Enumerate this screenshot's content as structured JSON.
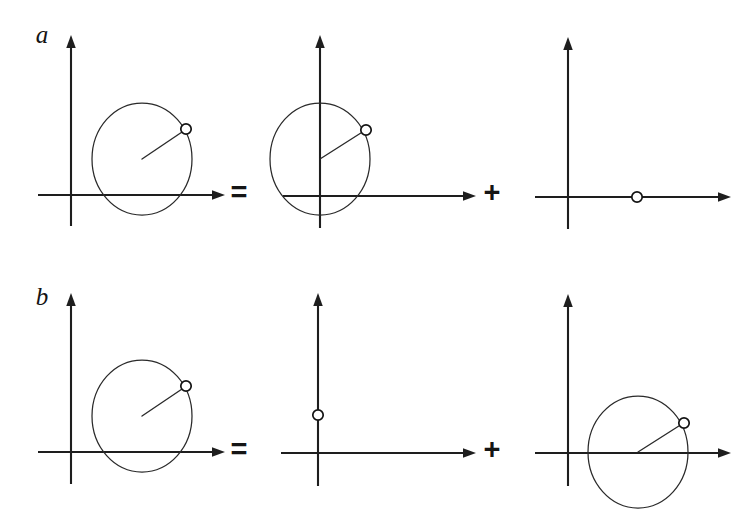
{
  "figure": {
    "kind": "phasor-decomposition-diagram",
    "background_color": "#ffffff",
    "line_color": "#1e1e1e",
    "curve_color": "#2a2a2a",
    "marker_fill": "#ffffff",
    "marker_stroke": "#121212",
    "width": 749,
    "height": 521
  },
  "rows": [
    {
      "id": "row-a",
      "label": "a",
      "label_pos": {
        "x": 42,
        "y": 34
      },
      "operators": [
        {
          "name": "equals",
          "symbol": "=",
          "x": 239,
          "y": 192
        },
        {
          "name": "plus",
          "symbol": "+",
          "x": 492,
          "y": 192
        }
      ],
      "panels": [
        {
          "id": "a1",
          "name": "rotating-phasor-circle-origin-offset",
          "origin": {
            "x": 71,
            "y": 195
          },
          "x_axis": {
            "x1": 38,
            "x2": 212,
            "y": 195,
            "arrow": "right"
          },
          "y_axis": {
            "y1": 226,
            "y2": 48,
            "x": 71,
            "arrow": "up"
          },
          "circle": {
            "cx": 142,
            "cy": 159,
            "rx": 50,
            "ry": 56
          },
          "vector": {
            "x1": 142,
            "y1": 159,
            "x2": 185,
            "y2": 130
          },
          "marker": {
            "cx": 186,
            "cy": 129,
            "r": 5.2
          }
        },
        {
          "id": "a2",
          "name": "phasor-circle-centered-on-y-axis",
          "origin": {
            "x": 320,
            "y": 196
          },
          "x_axis": {
            "x1": 283,
            "x2": 463,
            "y": 196,
            "arrow": "right"
          },
          "y_axis": {
            "y1": 228,
            "y2": 48,
            "x": 320,
            "arrow": "up"
          },
          "circle": {
            "cx": 320,
            "cy": 159,
            "rx": 50,
            "ry": 56
          },
          "vector": {
            "x1": 320,
            "y1": 159,
            "x2": 364,
            "y2": 131
          },
          "marker": {
            "cx": 366,
            "cy": 130,
            "r": 5.2
          }
        },
        {
          "id": "a3",
          "name": "static-phasor-on-x-axis",
          "origin": {
            "x": 568,
            "y": 197
          },
          "x_axis": {
            "x1": 535,
            "x2": 718,
            "y": 197,
            "arrow": "right"
          },
          "y_axis": {
            "y1": 229,
            "y2": 50,
            "x": 568,
            "arrow": "up"
          },
          "circle": null,
          "vector": null,
          "marker": {
            "cx": 637,
            "cy": 197,
            "r": 5.2
          }
        }
      ]
    },
    {
      "id": "row-b",
      "label": "b",
      "label_pos": {
        "x": 42,
        "y": 296
      },
      "operators": [
        {
          "name": "equals",
          "symbol": "=",
          "x": 239,
          "y": 449
        },
        {
          "name": "plus",
          "symbol": "+",
          "x": 492,
          "y": 449
        }
      ],
      "panels": [
        {
          "id": "b1",
          "name": "rotating-phasor-circle-origin-offset",
          "origin": {
            "x": 71,
            "y": 452
          },
          "x_axis": {
            "x1": 38,
            "x2": 212,
            "y": 452,
            "arrow": "right"
          },
          "y_axis": {
            "y1": 484,
            "y2": 306,
            "x": 71,
            "arrow": "up"
          },
          "circle": {
            "cx": 142,
            "cy": 416,
            "rx": 50,
            "ry": 56
          },
          "vector": {
            "x1": 142,
            "y1": 416,
            "x2": 185,
            "y2": 387
          },
          "marker": {
            "cx": 186,
            "cy": 386,
            "r": 5.2
          }
        },
        {
          "id": "b2",
          "name": "static-phasor-on-y-axis",
          "origin": {
            "x": 318,
            "y": 453
          },
          "x_axis": {
            "x1": 281,
            "x2": 463,
            "y": 453,
            "arrow": "right"
          },
          "y_axis": {
            "y1": 486,
            "y2": 306,
            "x": 318,
            "arrow": "up"
          },
          "circle": null,
          "vector": null,
          "marker": {
            "cx": 318,
            "cy": 415,
            "r": 5.2
          }
        },
        {
          "id": "b3",
          "name": "phasor-circle-centered-on-x-axis",
          "origin": {
            "x": 568,
            "y": 453
          },
          "x_axis": {
            "x1": 535,
            "x2": 718,
            "y": 453,
            "arrow": "right"
          },
          "y_axis": {
            "y1": 486,
            "y2": 307,
            "x": 568,
            "arrow": "up"
          },
          "circle": {
            "cx": 638,
            "cy": 452,
            "rx": 50,
            "ry": 56
          },
          "vector": {
            "x1": 638,
            "y1": 452,
            "x2": 682,
            "y2": 424
          },
          "marker": {
            "cx": 684,
            "cy": 423,
            "r": 5.2
          }
        }
      ]
    }
  ]
}
